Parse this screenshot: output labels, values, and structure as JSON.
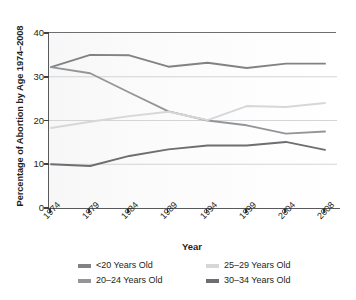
{
  "chart_data": {
    "type": "line",
    "title": "",
    "xlabel": "Year",
    "ylabel": "Percentage of Abortion by Age 1974–2008",
    "categories": [
      "1974",
      "1979",
      "1984",
      "1989",
      "1994",
      "1999",
      "2004",
      "2008"
    ],
    "x_tick_labels": [
      "1974",
      "1979",
      "1984",
      "1989",
      "1994",
      "1999",
      "2004",
      "2008"
    ],
    "y_tick_labels": [
      "0",
      "10",
      "20",
      "30",
      "40"
    ],
    "y_ticks": [
      0,
      10,
      20,
      30,
      40
    ],
    "ylim": [
      0,
      40
    ],
    "grid": "horizontal",
    "legend_position": "bottom",
    "series": [
      {
        "name": "<20 Years Old",
        "color": "#808285",
        "values": [
          32.2,
          35.0,
          34.9,
          32.3,
          33.2,
          32.0,
          33.0,
          33.0
        ]
      },
      {
        "name": "20–24 Years Old",
        "color": "#939598",
        "values": [
          32.2,
          30.8,
          26.4,
          22.1,
          20.0,
          18.9,
          17.0,
          17.5
        ]
      },
      {
        "name": "25–29 Years Old",
        "color": "#d6d7d8",
        "values": [
          18.3,
          19.7,
          21.0,
          22.0,
          20.1,
          23.3,
          23.1,
          24.0
        ]
      },
      {
        "name": "30–34 Years Old",
        "color": "#6d6e71",
        "values": [
          10.0,
          9.6,
          11.9,
          13.4,
          14.3,
          14.3,
          15.1,
          13.3
        ]
      }
    ]
  },
  "axis": {
    "y_title": "Percentage of Abortion by Age 1974–2008",
    "x_title": "Year"
  },
  "legend": {
    "items": [
      {
        "label": "<20 Years Old",
        "color": "#808285"
      },
      {
        "label": "25–29 Years Old",
        "color": "#d6d7d8"
      },
      {
        "label": "20–24 Years Old",
        "color": "#939598"
      },
      {
        "label": "30–34 Years Old",
        "color": "#6d6e71"
      }
    ]
  },
  "colors": {
    "axis": "#58595b",
    "text": "#231f20",
    "gridline": "#c9cacc",
    "plot_background": "#fafafa"
  }
}
